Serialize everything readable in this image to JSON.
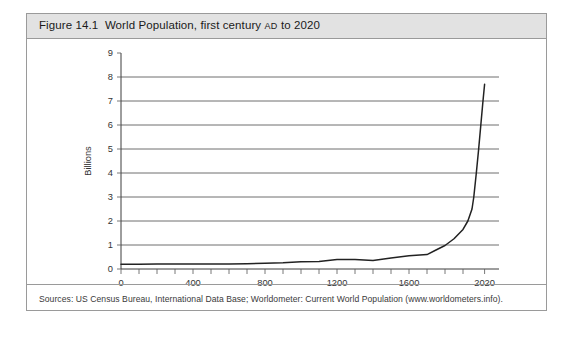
{
  "figure": {
    "title_prefix": "Figure 14.1",
    "title_text": "World Population, first century",
    "title_smallcaps": "AD",
    "title_suffix": "to 2020",
    "title_full": "Figure 14.1  World Population, first century AD to 2020",
    "source_note": "Sources:  US Census Bureau, International Data Base; Worldometer: Current World Population (www.worldometers.info).",
    "frame_border_color": "#9a9a9a",
    "titlebar_color": "#e2e2e2",
    "line_color": "#222222",
    "grid_color": "#4a4a4a"
  },
  "chart_data": {
    "type": "line",
    "xlabel": "",
    "ylabel": "Billions",
    "xlim": [
      0,
      2100
    ],
    "ylim": [
      0,
      9
    ],
    "ytick_values": [
      0,
      1,
      2,
      3,
      4,
      5,
      6,
      7,
      8,
      9
    ],
    "ytick_labels": [
      "0",
      "1",
      "2",
      "3",
      "4",
      "5",
      "6",
      "7",
      "8",
      "9"
    ],
    "gridline_values": [
      1,
      2,
      3,
      4,
      5,
      6,
      7,
      8
    ],
    "grid": true,
    "xtick_values": [
      0,
      100,
      200,
      300,
      400,
      500,
      600,
      700,
      800,
      900,
      1000,
      1100,
      1200,
      1300,
      1400,
      1500,
      1600,
      1700,
      1800,
      1900,
      2020
    ],
    "xtick_labeled_values": [
      0,
      400,
      800,
      1200,
      1600,
      2020
    ],
    "xtick_labels": [
      "0",
      "400",
      "800",
      "1200",
      "1600",
      "2020"
    ],
    "legend": null,
    "legend_position": "none",
    "series": [
      {
        "name": "World Population",
        "x": [
          0,
          100,
          200,
          300,
          400,
          500,
          600,
          700,
          800,
          900,
          1000,
          1100,
          1200,
          1300,
          1400,
          1500,
          1600,
          1700,
          1750,
          1800,
          1850,
          1900,
          1927,
          1950,
          1960,
          1974,
          1987,
          1999,
          2011,
          2020
        ],
        "values": [
          0.2,
          0.2,
          0.21,
          0.21,
          0.21,
          0.21,
          0.21,
          0.22,
          0.24,
          0.26,
          0.3,
          0.31,
          0.4,
          0.4,
          0.35,
          0.46,
          0.55,
          0.6,
          0.79,
          0.98,
          1.26,
          1.65,
          2.0,
          2.5,
          3.0,
          4.0,
          5.0,
          6.0,
          7.0,
          7.7
        ]
      }
    ],
    "annotations": []
  }
}
